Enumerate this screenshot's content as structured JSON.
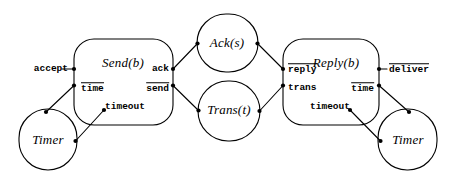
{
  "diagram": {
    "title": "",
    "type": "io-automaton-composition",
    "colors": {
      "stroke": "#000000",
      "background": "#ffffff",
      "port": "#000000"
    },
    "nodes": [
      {
        "id": "send",
        "label": "Send(b)",
        "shape": "rounded-box",
        "x": 123.5,
        "y": 82,
        "w": 99,
        "h": 86,
        "label_x": 123,
        "label_y": 63
      },
      {
        "id": "reply",
        "label": "Reply(b)",
        "shape": "rounded-box",
        "x": 330.5,
        "y": 82,
        "w": 95,
        "h": 86,
        "label_x": 336,
        "label_y": 63
      },
      {
        "id": "ack",
        "label": "Ack(s)",
        "shape": "circle",
        "x": 227.5,
        "y": 43,
        "w": 61,
        "h": 58,
        "label_x": 227,
        "label_y": 43
      },
      {
        "id": "trans",
        "label": "Trans(t)",
        "shape": "circle",
        "x": 229.0,
        "y": 110,
        "w": 63,
        "h": 60,
        "label_x": 229,
        "label_y": 110
      },
      {
        "id": "timer-l",
        "label": "Timer",
        "shape": "circle",
        "x": 48.0,
        "y": 139,
        "w": 58,
        "h": 60,
        "label_x": 48,
        "label_y": 140
      },
      {
        "id": "timer-r",
        "label": "Timer",
        "shape": "circle",
        "x": 407.0,
        "y": 139,
        "w": 58,
        "h": 60,
        "label_x": 408,
        "label_y": 140
      }
    ],
    "actions": [
      {
        "id": "accept",
        "text": "accept",
        "overline": false,
        "x": 31,
        "y": 69,
        "align": "l"
      },
      {
        "id": "time-l",
        "text": "time",
        "overline": true,
        "x": 81,
        "y": 88,
        "align": "l"
      },
      {
        "id": "ack",
        "text": "ack",
        "overline": false,
        "x": 169,
        "y": 69,
        "align": "r"
      },
      {
        "id": "send",
        "text": "send",
        "overline": true,
        "x": 169,
        "y": 88,
        "align": "r"
      },
      {
        "id": "timeout-l",
        "text": "timeout",
        "overline": false,
        "x": 125,
        "y": 107,
        "align": "c"
      },
      {
        "id": "reply",
        "text": "reply",
        "overline": true,
        "x": 288,
        "y": 69,
        "align": "l"
      },
      {
        "id": "trans",
        "text": "trans",
        "overline": false,
        "x": 288,
        "y": 88,
        "align": "l"
      },
      {
        "id": "time-r",
        "text": "time",
        "overline": true,
        "x": 374,
        "y": 88,
        "align": "r"
      },
      {
        "id": "timeout-r",
        "text": "timeout",
        "overline": false,
        "x": 330,
        "y": 107,
        "align": "c"
      },
      {
        "id": "deliver",
        "text": "deliver",
        "overline": true,
        "x": 388,
        "y": 69,
        "align": "l"
      }
    ],
    "ports": [
      {
        "id": "port-send-accept",
        "x": 74,
        "y": 69
      },
      {
        "id": "port-send-time",
        "x": 74,
        "y": 85
      },
      {
        "id": "port-send-ack",
        "x": 173,
        "y": 69
      },
      {
        "id": "port-send-send",
        "x": 173,
        "y": 85
      },
      {
        "id": "port-send-timeout",
        "x": 104,
        "y": 110
      },
      {
        "id": "port-timer-l-top",
        "x": 46,
        "y": 112
      },
      {
        "id": "port-timer-l-side",
        "x": 75,
        "y": 141
      },
      {
        "id": "port-ack-left",
        "x": 198,
        "y": 43
      },
      {
        "id": "port-ack-right",
        "x": 257,
        "y": 43
      },
      {
        "id": "port-trans-left",
        "x": 198,
        "y": 110
      },
      {
        "id": "port-trans-right",
        "x": 259,
        "y": 111
      },
      {
        "id": "port-reply-reply",
        "x": 283,
        "y": 69
      },
      {
        "id": "port-reply-trans",
        "x": 283,
        "y": 85
      },
      {
        "id": "port-reply-deliver",
        "x": 379,
        "y": 69
      },
      {
        "id": "port-reply-time",
        "x": 379,
        "y": 85
      },
      {
        "id": "port-reply-timeout",
        "x": 350,
        "y": 110
      },
      {
        "id": "port-timer-r-top",
        "x": 409,
        "y": 112
      },
      {
        "id": "port-timer-r-side",
        "x": 381,
        "y": 141
      }
    ],
    "edges": [
      {
        "id": "edge-accept",
        "from": "accept-stub",
        "to": "port-send-accept",
        "path": "M 62 69 L 74 69"
      },
      {
        "id": "edge-send-timer",
        "from": "port-send-time",
        "to": "port-timer-l-top",
        "path": "M 74 85 L 46 112"
      },
      {
        "id": "edge-timer-timeout",
        "from": "port-timer-l-side",
        "to": "port-send-timeout",
        "path": "M 75 141 L 104 110"
      },
      {
        "id": "edge-ack-in",
        "from": "port-send-ack",
        "to": "port-ack-left",
        "path": "M 173 69 L 198 43"
      },
      {
        "id": "edge-send-trans",
        "from": "port-send-send",
        "to": "port-trans-left",
        "path": "M 173 85 L 198 110"
      },
      {
        "id": "edge-ack-out",
        "from": "port-ack-right",
        "to": "port-reply-reply",
        "path": "M 257 43 L 283 69"
      },
      {
        "id": "edge-trans-out",
        "from": "port-trans-right",
        "to": "port-reply-trans",
        "path": "M 259 111 L 283 85"
      },
      {
        "id": "edge-deliver",
        "from": "port-reply-deliver",
        "to": "deliver-stub",
        "path": "M 379 69 L 386 69"
      },
      {
        "id": "edge-reply-timer",
        "from": "port-reply-time",
        "to": "port-timer-r-top",
        "path": "M 379 85 L 409 112"
      },
      {
        "id": "edge-timer-r-timeout",
        "from": "port-timer-r-side",
        "to": "port-reply-timeout",
        "path": "M 381 141 L 350 110"
      }
    ]
  }
}
